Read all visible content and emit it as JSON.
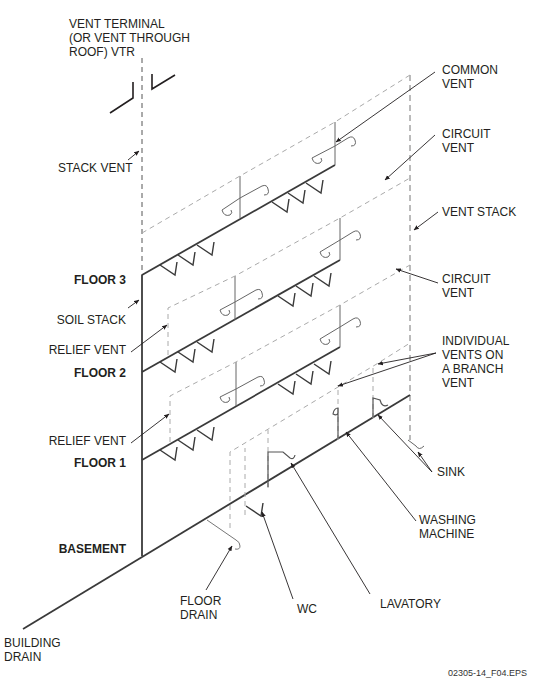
{
  "figure": {
    "id_label": "02305-14_F04.EPS",
    "colors": {
      "solid_pipe": "#3a3a3a",
      "vent_pipe": "#9a9a9a",
      "text": "#231f20",
      "leader": "#333333"
    }
  },
  "labels": {
    "vent_terminal": "VENT TERMINAL\n(OR VENT THROUGH\nROOF) VTR",
    "stack_vent": "STACK VENT",
    "common_vent": "COMMON\nVENT",
    "circuit_vent_top": "CIRCUIT\nVENT",
    "vent_stack": "VENT STACK",
    "circuit_vent_mid": "CIRCUIT\nVENT",
    "individual_vents": "INDIVIDUAL\nVENTS ON\nA BRANCH\nVENT",
    "floor3": "FLOOR 3",
    "soil_stack": "SOIL STACK",
    "relief_vent_upper": "RELIEF VENT",
    "floor2": "FLOOR 2",
    "relief_vent_lower": "RELIEF VENT",
    "floor1": "FLOOR 1",
    "basement": "BASEMENT",
    "sink": "SINK",
    "washing_machine": "WASHING\nMACHINE",
    "floor_drain": "FLOOR\nDRAIN",
    "wc": "WC",
    "lavatory": "LAVATORY",
    "building_drain": "BUILDING\nDRAIN"
  }
}
